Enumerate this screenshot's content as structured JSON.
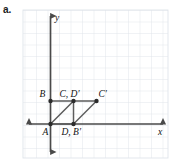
{
  "figure": {
    "part_label": "a.",
    "background": "#ffffff",
    "grid": {
      "color": "#d8dde4",
      "minor_color": "#e9edf2",
      "cell_px": 11.5,
      "left": 23,
      "top": 10,
      "right": 168,
      "bottom": 158,
      "cols": 13,
      "rows": 13
    },
    "axes": {
      "color": "#4a4a4a",
      "x_label": "x",
      "y_label": "y",
      "origin_px": {
        "x": 50.5,
        "y": 124
      }
    },
    "shape": {
      "stroke": "#5c5c5c",
      "point_color": "#2b2b2b",
      "point_radius": 2.2
    },
    "points": [
      {
        "id": "A",
        "label": "A",
        "px": 50.5,
        "py": 124,
        "label_dx": -8,
        "label_dy": 11
      },
      {
        "id": "B",
        "label": "B",
        "px": 50.5,
        "py": 101,
        "label_dx": -11,
        "label_dy": -4
      },
      {
        "id": "CD",
        "label": "C, D′",
        "px": 73.5,
        "py": 101,
        "label_dx": -14,
        "label_dy": -4
      },
      {
        "id": "DB",
        "label": "D, B′",
        "px": 73.5,
        "py": 124,
        "label_dx": -12,
        "label_dy": 11
      },
      {
        "id": "Cp",
        "label": "C′",
        "px": 96.5,
        "py": 101,
        "label_dx": 2,
        "label_dy": -4
      }
    ],
    "segments": [
      {
        "name": "segment-B-CD",
        "x1": 50.5,
        "y1": 101,
        "x2": 73.5,
        "y2": 101
      },
      {
        "name": "segment-CD-Cp",
        "x1": 73.5,
        "y1": 101,
        "x2": 96.5,
        "y2": 101
      },
      {
        "name": "segment-A-CD",
        "x1": 50.5,
        "y1": 124,
        "x2": 73.5,
        "y2": 101
      },
      {
        "name": "segment-CD-DB",
        "x1": 73.5,
        "y1": 101,
        "x2": 73.5,
        "y2": 124
      },
      {
        "name": "segment-DB-Cp",
        "x1": 73.5,
        "y1": 124,
        "x2": 96.5,
        "y2": 101
      },
      {
        "name": "segment-A-DB",
        "x1": 50.5,
        "y1": 124,
        "x2": 73.5,
        "y2": 124
      }
    ]
  }
}
